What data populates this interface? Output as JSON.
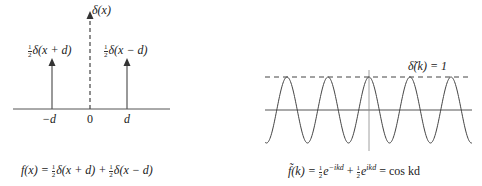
{
  "left_panel": {
    "delta_label": "δ(x)",
    "left_spike_label": "δ(x + d)",
    "right_spike_label": "δ(x − d)",
    "half_num": "1",
    "half_den": "2",
    "ticks": [
      "−d",
      "0",
      "d"
    ],
    "caption": {
      "lhs": "f(x) = ",
      "term1": "δ(x + d) + ",
      "term2": "δ(x − d)"
    }
  },
  "right_panel": {
    "dashed_label": "δ̃(k) = 1",
    "caption": {
      "lhs": "f̃(k) = ",
      "e1": "e",
      "exp1": "−ikd",
      "plus": " + ",
      "e2": "e",
      "exp2": "ikd",
      "rhs": " = cos kd"
    }
  },
  "colors": {
    "ink": "#333333",
    "background": "#ffffff"
  }
}
